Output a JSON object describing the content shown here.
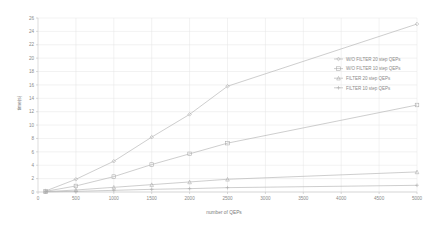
{
  "chart_data": {
    "type": "line",
    "title": "",
    "xlabel": "number of QEPs",
    "ylabel": "time(s)",
    "xlim": [
      0,
      5000
    ],
    "ylim": [
      0,
      26
    ],
    "grid": true,
    "legend_position": "right",
    "x_ticks": [
      0,
      500,
      1000,
      1500,
      2000,
      2500,
      3000,
      3500,
      4000,
      4500,
      5000
    ],
    "x_tick_labels": [
      "0",
      "500",
      "1000",
      "1500",
      "2000",
      "2500",
      "3000",
      "3500",
      "4000",
      "4500",
      "5000"
    ],
    "y_ticks": [
      0,
      2,
      4,
      6,
      8,
      10,
      12,
      14,
      16,
      18,
      20,
      22,
      24,
      26
    ],
    "y_tick_labels": [
      "0",
      "2",
      "4",
      "6",
      "8",
      "10",
      "12",
      "14",
      "16",
      "18",
      "20",
      "22",
      "24",
      "26"
    ],
    "x": [
      100,
      500,
      1000,
      1500,
      2000,
      2500,
      5000
    ],
    "series": [
      {
        "name": "W/O FILTER 20 step QEPs",
        "marker": "diamond",
        "color": "#b4b4b4",
        "values": [
          0.15,
          1.9,
          4.6,
          8.2,
          11.6,
          15.8,
          25.1
        ]
      },
      {
        "name": "W/O FILTER 10 step QEPs",
        "marker": "square",
        "color": "#b4b4b4",
        "values": [
          0.1,
          0.9,
          2.3,
          4.1,
          5.7,
          7.3,
          13.0
        ]
      },
      {
        "name": "FILTER 20 step QEPs",
        "marker": "triangle",
        "color": "#b4b4b4",
        "values": [
          0.05,
          0.3,
          0.7,
          1.1,
          1.5,
          1.9,
          3.0
        ]
      },
      {
        "name": "FILTER 10 step QEPs",
        "marker": "cross",
        "color": "#b4b4b4",
        "values": [
          0.02,
          0.1,
          0.25,
          0.4,
          0.5,
          0.65,
          1.0
        ]
      }
    ]
  }
}
